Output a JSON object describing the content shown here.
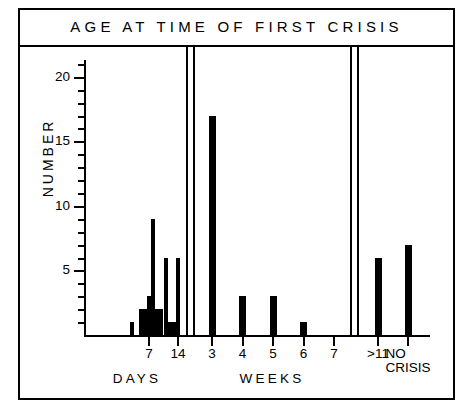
{
  "figure": {
    "title": "AGE AT TIME OF FIRST CRISIS",
    "y_axis_title": "NUMBER"
  },
  "chart_data": {
    "type": "bar",
    "title": "AGE AT TIME OF FIRST CRISIS",
    "xlabel": "",
    "ylabel": "NUMBER",
    "ylim": [
      0,
      21
    ],
    "yticks": [
      0,
      5,
      10,
      15,
      20
    ],
    "ytick_labels": [
      "",
      "5",
      "10",
      "15",
      "20"
    ],
    "minor_tick_step": 1,
    "grid": false,
    "legend": "none",
    "sections": [
      {
        "name": "DAYS",
        "axis_tick_labels": [
          "7",
          "14"
        ],
        "categories": [
          "3",
          "4",
          "5",
          "6",
          "7",
          "8",
          "9",
          "10",
          "11",
          "12",
          "13",
          "14"
        ],
        "values": [
          1,
          0,
          2,
          2,
          3,
          9,
          2,
          2,
          6,
          1,
          1,
          6
        ]
      },
      {
        "name": "WEEKS",
        "axis_tick_labels": [
          "3",
          "4",
          "5",
          "6",
          "7"
        ],
        "categories": [
          "3",
          "4",
          "5",
          "6",
          "7"
        ],
        "values": [
          17,
          3,
          3,
          1,
          0
        ]
      },
      {
        "name": "NO CRISIS",
        "axis_tick_labels": [
          ">11",
          "NO CRISIS"
        ],
        "categories": [
          ">11",
          "NO CRISIS"
        ],
        "values": [
          6,
          7
        ]
      }
    ]
  },
  "ytick_labels": {
    "t20": "20",
    "t15": "15",
    "t10": "10",
    "t5": "5"
  },
  "xtick_labels": {
    "days_7": "7",
    "days_14": "14",
    "weeks_3": "3",
    "weeks_4": "4",
    "weeks_5": "5",
    "weeks_6": "6",
    "weeks_7": "7",
    "gt11": ">11",
    "nocrisis_line1": "NO",
    "nocrisis_line2": "CRISIS"
  },
  "group_labels": {
    "days": "DAYS",
    "weeks": "WEEKS"
  },
  "colors": {
    "ink": "#000000",
    "paper": "#ffffff"
  }
}
